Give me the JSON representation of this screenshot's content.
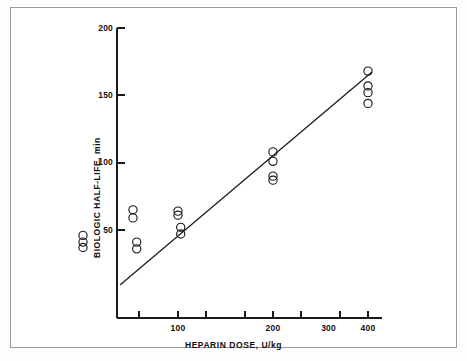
{
  "figure": {
    "border_color": "#9a9a9a",
    "background": "#ffffff"
  },
  "axes": {
    "x_label": "HEPARIN DOSE, U/kg",
    "y_label": "BIOLOGIC HALF-LIFE, min",
    "x_ticks": [
      "100",
      "200",
      "300",
      "400"
    ],
    "y_ticks": [
      "50",
      "100",
      "150",
      "200"
    ]
  },
  "chart_data": {
    "type": "scatter",
    "title": "",
    "xlabel": "HEPARIN DOSE, U/kg",
    "ylabel": "BIOLOGIC HALF-LIFE, min",
    "x_scale": "log",
    "y_scale": "linear",
    "xlim": [
      40,
      470
    ],
    "ylim": [
      25,
      200
    ],
    "x_tick_values": [
      100,
      200,
      300,
      400
    ],
    "x_minor_tick_values": [
      50,
      150,
      250,
      350
    ],
    "y_tick_values": [
      50,
      100,
      150,
      200
    ],
    "grid": false,
    "legend": null,
    "marker": "open-circle",
    "series": [
      {
        "name": "Subjects",
        "points": [
          {
            "x": 50,
            "y": 46
          },
          {
            "x": 50,
            "y": 41
          },
          {
            "x": 50,
            "y": 37
          },
          {
            "x": 72,
            "y": 65
          },
          {
            "x": 72,
            "y": 59
          },
          {
            "x": 74,
            "y": 41
          },
          {
            "x": 74,
            "y": 36
          },
          {
            "x": 100,
            "y": 64
          },
          {
            "x": 100,
            "y": 61
          },
          {
            "x": 102,
            "y": 52
          },
          {
            "x": 102,
            "y": 47
          },
          {
            "x": 200,
            "y": 108
          },
          {
            "x": 200,
            "y": 101
          },
          {
            "x": 200,
            "y": 90
          },
          {
            "x": 200,
            "y": 87
          },
          {
            "x": 400,
            "y": 168
          },
          {
            "x": 400,
            "y": 157
          },
          {
            "x": 400,
            "y": 152
          },
          {
            "x": 400,
            "y": 144
          }
        ]
      }
    ],
    "fit_line": {
      "name": "regression line",
      "x_start": 43,
      "y_start": 34,
      "x_end": 455,
      "y_end": 172
    }
  }
}
